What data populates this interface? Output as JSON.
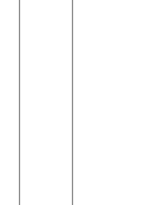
{
  "canvas": {
    "width": 146,
    "height": 205,
    "background": "#ffffff"
  },
  "lines": [
    {
      "orientation": "vertical",
      "x": 19,
      "color": "#8a8a8a"
    },
    {
      "orientation": "vertical",
      "x": 72,
      "color": "#8a8a8a"
    }
  ]
}
